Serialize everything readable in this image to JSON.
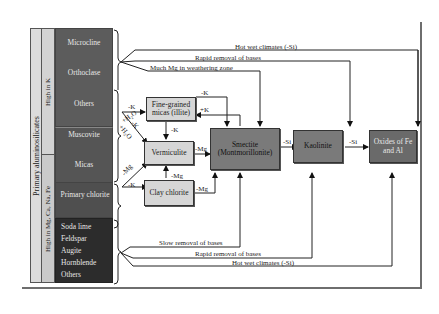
{
  "left_panel": {
    "outer_label": "Primary aluminosilicates",
    "group_labels": {
      "high_k": "High in K",
      "high_mg": "High in Mg, Ca, Na, Fe"
    },
    "minerals": [
      {
        "name": "Microcline"
      },
      {
        "name": "Orthoclase"
      },
      {
        "name": "Others"
      },
      {
        "name": "Muscovite"
      },
      {
        "name": "Micas"
      },
      {
        "name": "Biotite"
      },
      {
        "name": "Primary chlorite"
      },
      {
        "name": "Soda lime"
      },
      {
        "name": "Feldspar"
      },
      {
        "name": "Augite"
      },
      {
        "name": "Hornblende"
      },
      {
        "name": "Others"
      }
    ]
  },
  "boxes": {
    "illite": "Fine-grained micas (illite)",
    "vermiculite": "Vermiculite",
    "clay_chlorite": "Clay chlorite",
    "smectite": "Smectite (Montmorillonite)",
    "kaolinite": "Kaolinite",
    "oxides": "Oxides of Fe and Al"
  },
  "arrows": {
    "minus_k_top": "-K",
    "plus_h2o_top": "+H₂O",
    "k_diag": "-K",
    "plus_h2o_diag": "+H₂O",
    "minus_mg_diag": "-Mg",
    "minus_k_bottom": "-K",
    "illite_minus_k_to_smectite": "-K",
    "smectite_plus_k_to_illite": "+K",
    "illite_minus_k_to_vermiculite": "-K",
    "vermiculite_minus_mg": "-Mg",
    "chlorite_minus_mg_up": "-Mg",
    "chlorite_minus_mg_right": "-Mg",
    "smectite_minus_si": "-Si",
    "kaolinite_minus_si": "-Si"
  },
  "pathways": {
    "top_hot_wet": "Hot wet climates (-Si)",
    "top_rapid": "Rapid removal of bases",
    "top_much_mg": "Much Mg in weathering zone",
    "bottom_slow": "Slow removal of bases",
    "bottom_rapid": "Rapid removal of bases",
    "bottom_hot_wet": "Hot wet climates (-Si)"
  },
  "colors": {
    "outer_column": "#d9d9d9",
    "group_column": "#cfcfcf",
    "high_k_minerals": "#5a5a5a",
    "high_mg_minerals": "#2f2f2f",
    "box_light": "#d6d6d6",
    "box_mid": "#7a7a7a",
    "box_dark": "#6a6a6a"
  }
}
